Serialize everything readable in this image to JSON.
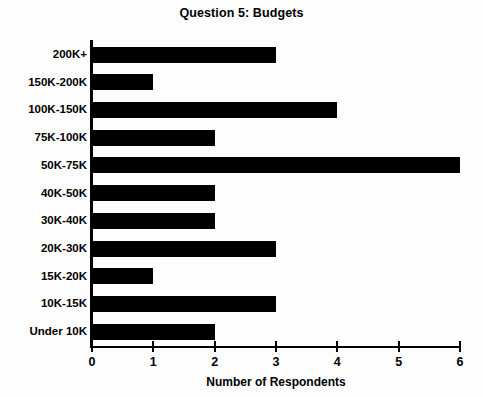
{
  "chart_data": {
    "type": "bar",
    "orientation": "horizontal",
    "title": "Question 5: Budgets",
    "xlabel": "Number of Respondents",
    "ylabel": "",
    "xlim": [
      0,
      6
    ],
    "xticks": [
      0,
      1,
      2,
      3,
      4,
      5,
      6
    ],
    "xtick_labels": [
      "0",
      "1",
      "2",
      "3",
      "4",
      "5",
      "6"
    ],
    "grid": false,
    "legend": null,
    "bar_color": "#000000",
    "background_color": "#fdfdfd",
    "categories": [
      "200K+",
      "150K-200K",
      "100K-150K",
      "75K-100K",
      "50K-75K",
      "40K-50K",
      "30K-40K",
      "20K-30K",
      "15K-20K",
      "10K-15K",
      "Under 10K"
    ],
    "values": [
      3,
      1,
      4,
      2,
      6,
      2,
      2,
      3,
      1,
      3,
      2
    ]
  }
}
